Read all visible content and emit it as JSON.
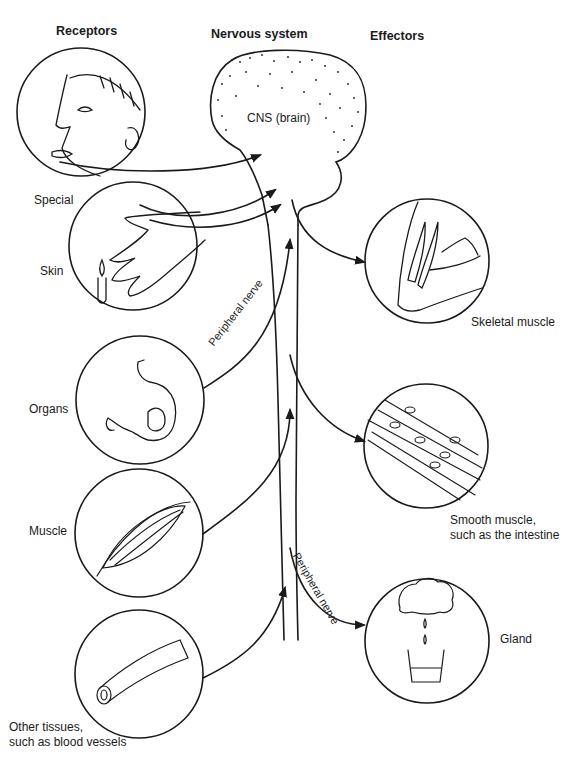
{
  "headers": {
    "receptors": "Receptors",
    "nervous_system": "Nervous system",
    "effectors": "Effectors"
  },
  "center": {
    "brain_label": "CNS (brain)",
    "nerve_label_upper": "Peripheral nerve",
    "nerve_label_lower": "Peripheral nerve"
  },
  "receptors": [
    {
      "label": "Special",
      "icon": "face-tongue-ear-icon"
    },
    {
      "label": "Skin",
      "icon": "hand-candle-icon"
    },
    {
      "label": "Organs",
      "icon": "stomach-icon"
    },
    {
      "label": "Muscle",
      "icon": "muscle-spindle-icon"
    },
    {
      "label": "Other tissues,",
      "label2": "such as blood vessels",
      "icon": "blood-vessel-icon"
    }
  ],
  "effectors": [
    {
      "label": "Skeletal muscle",
      "icon": "arm-biceps-icon"
    },
    {
      "label": "Smooth muscle,",
      "label2": "such as the intestine",
      "icon": "smooth-muscle-cells-icon"
    },
    {
      "label": "Gland",
      "icon": "gland-secretion-icon"
    }
  ]
}
